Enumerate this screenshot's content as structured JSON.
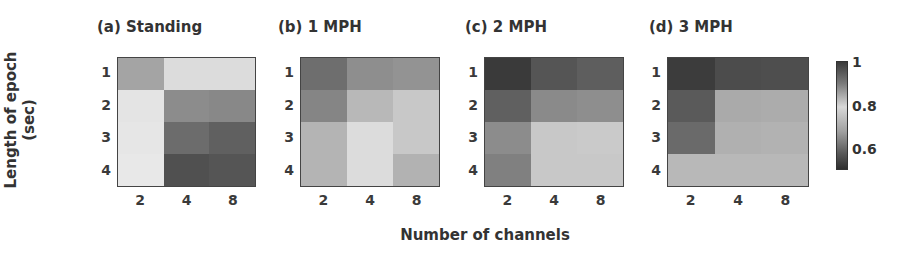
{
  "chart_data": {
    "type": "heatmap",
    "title": "",
    "xlabel": "Number of channels",
    "ylabel": "Length of epoch (sec)",
    "x_categories": [
      "2",
      "4",
      "8"
    ],
    "y_categories": [
      "1",
      "2",
      "3",
      "4"
    ],
    "colorbar": {
      "ticks": [
        "1",
        "0.8",
        "0.6"
      ],
      "range": [
        0.53,
        1.0
      ]
    },
    "panels": [
      {
        "title": "(a) Standing",
        "values": [
          [
            0.84,
            0.92,
            0.92
          ],
          [
            0.95,
            0.76,
            0.75
          ],
          [
            0.95,
            0.68,
            0.64
          ],
          [
            0.96,
            0.6,
            0.61
          ]
        ],
        "colors": [
          [
            "#a4a4a4",
            "#dcdcdc",
            "#dcdcdc"
          ],
          [
            "#e4e4e4",
            "#8c8c8c",
            "#888888"
          ],
          [
            "#e6e6e6",
            "#6c6c6c",
            "#606060"
          ],
          [
            "#e8e8e8",
            "#505050",
            "#555555"
          ]
        ]
      },
      {
        "title": "(b) 1 MPH",
        "values": [
          [
            0.68,
            0.77,
            0.78
          ],
          [
            0.74,
            0.86,
            0.9
          ],
          [
            0.85,
            0.93,
            0.9
          ],
          [
            0.85,
            0.93,
            0.84
          ]
        ],
        "colors": [
          [
            "#6e6e6e",
            "#8e8e8e",
            "#939393"
          ],
          [
            "#858585",
            "#b8b8b8",
            "#c8c8c8"
          ],
          [
            "#b4b4b4",
            "#dcdcdc",
            "#c8c8c8"
          ],
          [
            "#b4b4b4",
            "#dcdcdc",
            "#b2b2b2"
          ]
        ]
      },
      {
        "title": "(c) 2 MPH",
        "values": [
          [
            0.55,
            0.62,
            0.65
          ],
          [
            0.63,
            0.77,
            0.78
          ],
          [
            0.77,
            0.88,
            0.88
          ],
          [
            0.73,
            0.88,
            0.88
          ]
        ],
        "colors": [
          [
            "#3a3a3a",
            "#555555",
            "#5e5e5e"
          ],
          [
            "#606060",
            "#8a8a8a",
            "#8e8e8e"
          ],
          [
            "#8c8c8c",
            "#c8c8c8",
            "#cacaca"
          ],
          [
            "#808080",
            "#c8c8c8",
            "#c8c8c8"
          ]
        ]
      },
      {
        "title": "(d) 3 MPH",
        "values": [
          [
            0.54,
            0.59,
            0.6
          ],
          [
            0.61,
            0.83,
            0.83
          ],
          [
            0.65,
            0.84,
            0.84
          ],
          [
            0.85,
            0.85,
            0.85
          ]
        ],
        "colors": [
          [
            "#3c3c3c",
            "#4c4c4c",
            "#4e4e4e"
          ],
          [
            "#5a5a5a",
            "#aaaaaa",
            "#acacac"
          ],
          [
            "#6a6a6a",
            "#b0b0b0",
            "#b2b2b2"
          ],
          [
            "#b8b8b8",
            "#b8b8b8",
            "#b8b8b8"
          ]
        ]
      }
    ],
    "grid": false,
    "legend_position": "right (colorbar)"
  },
  "labels": {
    "xlabel": "Number of channels",
    "ylabel_line1": "Length of epoch",
    "ylabel_line2": "(sec)",
    "cb_1": "1",
    "cb_08": "0.8",
    "cb_06": "0.6"
  }
}
